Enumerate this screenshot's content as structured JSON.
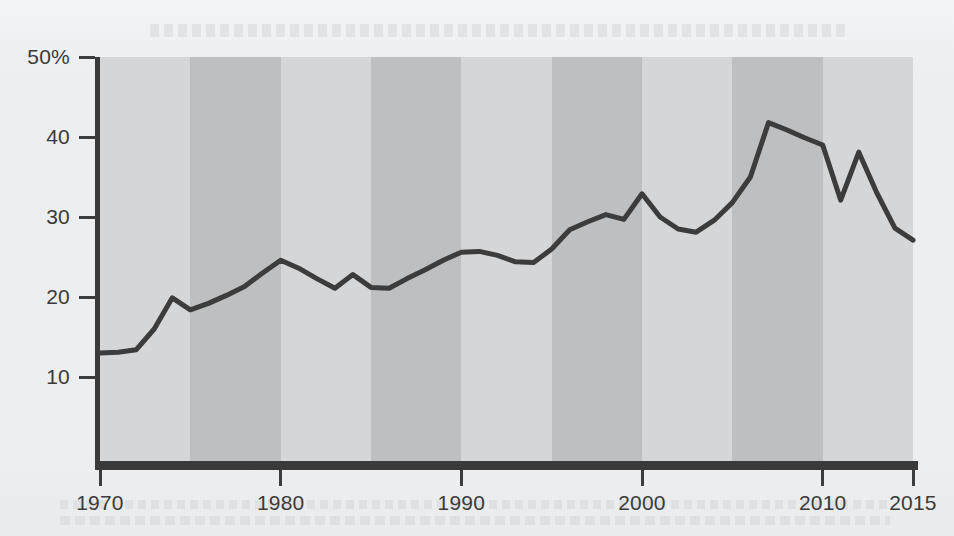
{
  "chart_data": {
    "type": "line",
    "title": "",
    "subtitle": "",
    "xlabel": "",
    "ylabel": "",
    "xlim": [
      1970,
      2015
    ],
    "ylim": [
      0,
      50
    ],
    "grid": false,
    "legend": "none",
    "y_tick_labels": [
      "50%",
      "40",
      "30",
      "20",
      "10"
    ],
    "y_tick_values": [
      50,
      40,
      30,
      20,
      10
    ],
    "x_tick_labels": [
      "1970",
      "1980",
      "1990",
      "2000",
      "2010",
      "2015"
    ],
    "x_tick_values": [
      1970,
      1980,
      1990,
      2000,
      2010,
      2015
    ],
    "band_shading": {
      "note": "alternating 5-year vertical bands",
      "light_color": "#d5d6d7",
      "dark_color": "#bdbfc0",
      "period_years": 5,
      "start_year": 1970
    },
    "line_color": "#3c3c3c",
    "line_width": 5,
    "series": [
      {
        "name": "share",
        "x": [
          1970,
          1971,
          1972,
          1973,
          1974,
          1975,
          1976,
          1977,
          1978,
          1979,
          1980,
          1981,
          1982,
          1983,
          1984,
          1985,
          1986,
          1987,
          1988,
          1989,
          1990,
          1991,
          1992,
          1993,
          1994,
          1995,
          1996,
          1997,
          1998,
          1999,
          2000,
          2001,
          2002,
          2003,
          2004,
          2005,
          2006,
          2007,
          2008,
          2009,
          2010,
          2011,
          2012,
          2013,
          2014,
          2015
        ],
        "values": [
          13.0,
          13.1,
          13.4,
          16.0,
          19.9,
          18.4,
          19.2,
          20.2,
          21.3,
          23.0,
          24.6,
          23.6,
          22.3,
          21.1,
          22.8,
          21.2,
          21.1,
          22.3,
          23.4,
          24.6,
          25.6,
          25.7,
          25.2,
          24.4,
          24.3,
          26.0,
          28.4,
          29.4,
          30.3,
          29.7,
          32.9,
          30.0,
          28.5,
          28.1,
          29.6,
          31.8,
          35.0,
          41.8,
          40.9,
          39.9,
          39.0,
          32.1,
          38.1,
          33.0,
          28.6,
          27.1
        ]
      }
    ]
  },
  "axes": {
    "y_axis_label": "",
    "x_axis_label": ""
  }
}
